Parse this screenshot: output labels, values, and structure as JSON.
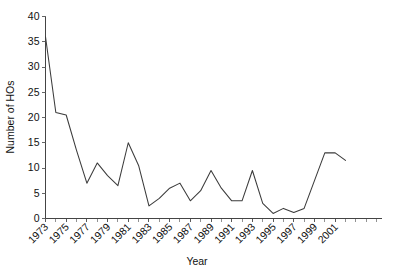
{
  "chart_data": {
    "type": "line",
    "title": "",
    "xlabel": "Year",
    "ylabel": "Number of HOs",
    "grid": false,
    "legend": "none",
    "xlim": [
      1973,
      2002
    ],
    "ylim": [
      0,
      40
    ],
    "yticks": [
      0,
      5,
      10,
      15,
      20,
      25,
      30,
      35,
      40
    ],
    "ytick_labels": [
      "0",
      "5",
      "10",
      "15",
      "20",
      "25",
      "30",
      "35",
      "40"
    ],
    "xtick_labels": [
      "1973",
      "1975",
      "1977",
      "1979",
      "1981",
      "1983",
      "1985",
      "1987",
      "1989",
      "1991",
      "1993",
      "1995",
      "1997",
      "1999",
      "2001"
    ],
    "xticks": [
      1973,
      1975,
      1977,
      1979,
      1981,
      1983,
      1985,
      1987,
      1989,
      1991,
      1993,
      1995,
      1997,
      1999,
      2001
    ],
    "x": [
      1973,
      1974,
      1975,
      1976,
      1977,
      1978,
      1979,
      1980,
      1981,
      1982,
      1983,
      1984,
      1985,
      1986,
      1987,
      1988,
      1989,
      1990,
      1991,
      1992,
      1993,
      1994,
      1995,
      1996,
      1997,
      1998,
      1999,
      2000,
      2001,
      2002
    ],
    "values": [
      36,
      21,
      20.5,
      13.5,
      7,
      11,
      8.5,
      6.5,
      15,
      10.5,
      2.5,
      4,
      6,
      7,
      3.5,
      5.5,
      9.5,
      6,
      3.5,
      3.5,
      9.5,
      3,
      1,
      2,
      1.2,
      2,
      7.5,
      13,
      13,
      11.5
    ],
    "series": [
      {
        "name": "Number of HOs",
        "values": [
          36,
          21,
          20.5,
          13.5,
          7,
          11,
          8.5,
          6.5,
          15,
          10.5,
          2.5,
          4,
          6,
          7,
          3.5,
          5.5,
          9.5,
          6,
          3.5,
          3.5,
          9.5,
          3,
          1,
          2,
          1.2,
          2,
          7.5,
          13,
          13,
          11.5
        ]
      }
    ],
    "line_color": "#3b3b3b",
    "axis_color": "#444444",
    "background_color": "#ffffff"
  }
}
